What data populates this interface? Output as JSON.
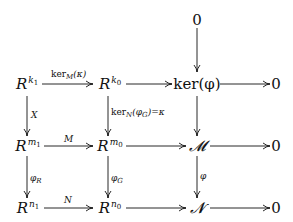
{
  "diagram": {
    "type": "commutative-diagram",
    "nodes": {
      "top_zero": "0",
      "Rk1_base": "R",
      "Rk1_exp": "k",
      "Rk1_sub": "1",
      "Rk0_base": "R",
      "Rk0_exp": "k",
      "Rk0_sub": "0",
      "ker_phi": "ker(φ)",
      "zero_r1": "0",
      "Rm1_base": "R",
      "Rm1_exp": "m",
      "Rm1_sub": "1",
      "Rm0_base": "R",
      "Rm0_exp": "m",
      "Rm0_sub": "0",
      "M_cal": "𝓜",
      "zero_r2": "0",
      "Rn1_base": "R",
      "Rn1_exp": "n",
      "Rn1_sub": "1",
      "Rn0_base": "R",
      "Rn0_exp": "n",
      "Rn0_sub": "0",
      "N_cal": "𝓝",
      "zero_r3": "0"
    },
    "labels": {
      "kerM_kappa": "ker",
      "kerM_sub": "M",
      "kerM_arg": "(κ)",
      "X": "X",
      "kerN_label": "ker",
      "kerN_sub": "N",
      "kerN_arg": "(φ",
      "kerN_arg_sub": "G",
      "kerN_rest": ")=κ",
      "M": "M",
      "N": "N",
      "phi_R": "φ",
      "phi_R_sub": "R",
      "phi_G": "φ",
      "phi_G_sub": "G",
      "phi": "φ"
    },
    "arrows": [
      {
        "from": "Rk1",
        "to": "Rk0",
        "label": "ker_M(κ)"
      },
      {
        "from": "Rk0",
        "to": "ker(φ)",
        "label": ""
      },
      {
        "from": "ker(φ)",
        "to": "0",
        "label": ""
      },
      {
        "from": "0",
        "to": "ker(φ)",
        "label": ""
      },
      {
        "from": "Rk1",
        "to": "Rm1",
        "label": "X"
      },
      {
        "from": "Rk0",
        "to": "Rm0",
        "label": "ker_N(φ_G)=κ"
      },
      {
        "from": "ker(φ)",
        "to": "M",
        "label": ""
      },
      {
        "from": "Rm1",
        "to": "Rm0",
        "label": "M"
      },
      {
        "from": "Rm0",
        "to": "M",
        "label": ""
      },
      {
        "from": "M",
        "to": "0",
        "label": ""
      },
      {
        "from": "Rm1",
        "to": "Rn1",
        "label": "φ_R"
      },
      {
        "from": "Rm0",
        "to": "Rn0",
        "label": "φ_G"
      },
      {
        "from": "M",
        "to": "N",
        "label": "φ"
      },
      {
        "from": "Rn1",
        "to": "Rn0",
        "label": "N"
      },
      {
        "from": "Rn0",
        "to": "N",
        "label": ""
      },
      {
        "from": "N",
        "to": "0",
        "label": ""
      }
    ]
  }
}
